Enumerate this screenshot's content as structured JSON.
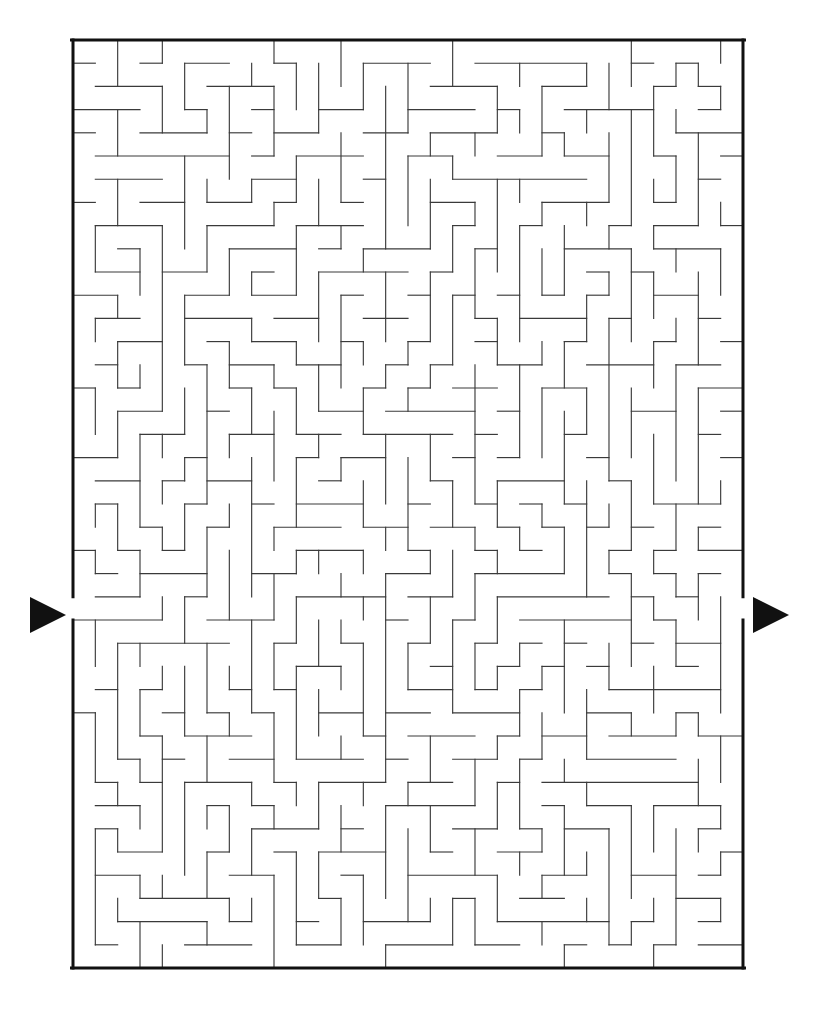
{
  "page": {
    "kind": "maze-puzzle",
    "background_color": "#ffffff",
    "width": 819,
    "height": 1015
  },
  "maze": {
    "columns": 30,
    "rows": 40,
    "cell_width": 22.333,
    "cell_height": 23.2,
    "origin_x": 73,
    "origin_y": 40,
    "board_width": 670,
    "board_height": 928,
    "border_color": "#111111",
    "border_thickness": 3,
    "wall_color": "#3a3a3a",
    "wall_thickness": 1.15,
    "seed": 20240917
  },
  "entrance": {
    "label": "entrance",
    "side": "left",
    "row": 24,
    "arrow_color": "#111111",
    "arrow_x": 30,
    "arrow_y": 615,
    "arrow_width": 36,
    "arrow_height": 36,
    "direction": "right"
  },
  "exit": {
    "label": "exit",
    "side": "right",
    "row": 24,
    "arrow_color": "#111111",
    "arrow_x": 753,
    "arrow_y": 615,
    "arrow_width": 36,
    "arrow_height": 36,
    "direction": "right"
  }
}
